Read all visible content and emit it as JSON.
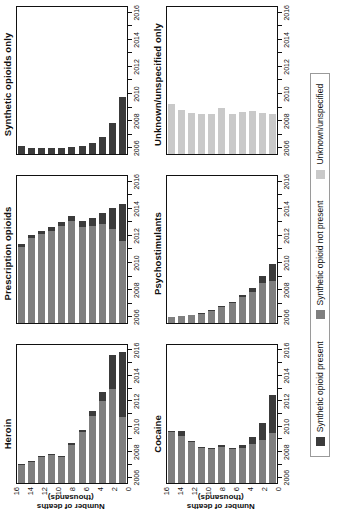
{
  "figure": {
    "y_axis_label": "Number of deaths (thousands)",
    "y_ticks": [
      "16",
      "14",
      "12",
      "10",
      "8",
      "6",
      "4",
      "2",
      "0"
    ],
    "x_tick_labels": [
      "2006",
      "2008",
      "2010",
      "2012",
      "2014",
      "2016"
    ]
  },
  "legend": {
    "items": [
      {
        "label": "Synthetic opioid present",
        "color": "#3b3b3b",
        "key": "present"
      },
      {
        "label": "Synthetic opioid not present",
        "color": "#7f7f7f",
        "key": "notpresent"
      },
      {
        "label": "Unknown/unspecified",
        "color": "#c9c9c9",
        "key": "unknown"
      }
    ]
  },
  "panels": [
    {
      "title": "Heroin"
    },
    {
      "title": "Prescription opioids"
    },
    {
      "title": "Synthetic opioids only"
    },
    {
      "title": "Cocaine"
    },
    {
      "title": "Psychostimulants"
    },
    {
      "title": "Unknown/unspecified only"
    }
  ],
  "chart_data": [
    {
      "type": "bar",
      "title": "Heroin",
      "xlabel": "",
      "ylabel": "Number of deaths (thousands)",
      "ylim": [
        0,
        16
      ],
      "grid": false,
      "stacked": true,
      "orientation": "vertical-bars-rendered-horizontal",
      "categories": [
        "2006",
        "2007",
        "2008",
        "2009",
        "2010",
        "2011",
        "2012",
        "2013",
        "2014",
        "2015",
        "2016"
      ],
      "series": [
        {
          "name": "Synthetic opioid not present",
          "color": "#7f7f7f",
          "values": [
            2.1,
            2.4,
            3.0,
            3.3,
            3.0,
            4.4,
            5.9,
            7.8,
            9.5,
            10.9,
            7.6
          ]
        },
        {
          "name": "Synthetic opioid present",
          "color": "#3b3b3b",
          "values": [
            0.1,
            0.1,
            0.1,
            0.1,
            0.1,
            0.2,
            0.3,
            0.5,
            1.1,
            3.9,
            7.6
          ]
        }
      ],
      "totals": [
        2.2,
        2.5,
        3.1,
        3.4,
        3.1,
        4.6,
        6.2,
        8.3,
        10.6,
        14.8,
        15.2
      ]
    },
    {
      "type": "bar",
      "title": "Prescription opioids",
      "xlabel": "",
      "ylabel": "",
      "ylim": [
        0,
        16
      ],
      "grid": false,
      "stacked": true,
      "categories": [
        "2006",
        "2007",
        "2008",
        "2009",
        "2010",
        "2011",
        "2012",
        "2013",
        "2014",
        "2015",
        "2016"
      ],
      "series": [
        {
          "name": "Synthetic opioid not present",
          "color": "#7f7f7f",
          "values": [
            8.3,
            9.3,
            9.7,
            10.0,
            10.6,
            11.1,
            10.5,
            10.6,
            10.8,
            10.2,
            8.9
          ]
        },
        {
          "name": "Synthetic opioid present",
          "color": "#3b3b3b",
          "values": [
            0.3,
            0.3,
            0.3,
            0.4,
            0.4,
            0.5,
            0.6,
            0.8,
            1.2,
            2.3,
            4.0
          ]
        }
      ],
      "totals": [
        8.6,
        9.6,
        10.0,
        10.4,
        11.0,
        11.6,
        11.1,
        11.4,
        12.0,
        12.5,
        12.9
      ]
    },
    {
      "type": "bar",
      "title": "Synthetic opioids only",
      "xlabel": "",
      "ylabel": "",
      "ylim": [
        0,
        16
      ],
      "grid": false,
      "stacked": true,
      "categories": [
        "2006",
        "2007",
        "2008",
        "2009",
        "2010",
        "2011",
        "2012",
        "2013",
        "2014",
        "2015",
        "2016"
      ],
      "series": [
        {
          "name": "Synthetic opioid present",
          "color": "#3b3b3b",
          "values": [
            0.9,
            0.6,
            0.6,
            0.6,
            0.7,
            0.8,
            0.9,
            1.2,
            1.9,
            3.4,
            6.2
          ]
        }
      ],
      "totals": [
        0.9,
        0.6,
        0.6,
        0.6,
        0.7,
        0.8,
        0.9,
        1.2,
        1.9,
        3.4,
        6.2
      ]
    },
    {
      "type": "bar",
      "title": "Cocaine",
      "xlabel": "",
      "ylabel": "Number of deaths (thousands)",
      "ylim": [
        0,
        16
      ],
      "grid": false,
      "stacked": true,
      "categories": [
        "2006",
        "2007",
        "2008",
        "2009",
        "2010",
        "2011",
        "2012",
        "2013",
        "2014",
        "2015",
        "2016"
      ],
      "series": [
        {
          "name": "Synthetic opioid not present",
          "color": "#7f7f7f",
          "values": [
            5.9,
            5.4,
            4.8,
            4.0,
            3.9,
            4.2,
            3.9,
            4.1,
            4.5,
            5.0,
            5.8
          ]
        },
        {
          "name": "Synthetic opioid present",
          "color": "#3b3b3b",
          "values": [
            0.1,
            0.6,
            0.1,
            0.1,
            0.1,
            0.2,
            0.2,
            0.3,
            0.8,
            1.9,
            4.4
          ]
        }
      ],
      "totals": [
        6.0,
        6.0,
        4.9,
        4.1,
        4.0,
        4.4,
        4.1,
        4.4,
        5.3,
        6.9,
        10.2
      ]
    },
    {
      "type": "bar",
      "title": "Psychostimulants",
      "xlabel": "",
      "ylabel": "",
      "ylim": [
        0,
        16
      ],
      "grid": false,
      "stacked": true,
      "categories": [
        "2006",
        "2007",
        "2008",
        "2009",
        "2010",
        "2011",
        "2012",
        "2013",
        "2014",
        "2015",
        "2016"
      ],
      "series": [
        {
          "name": "Synthetic opioid not present",
          "color": "#7f7f7f",
          "values": [
            0.7,
            0.8,
            0.9,
            1.0,
            1.3,
            1.7,
            2.2,
            2.8,
            3.4,
            4.3,
            4.6
          ]
        },
        {
          "name": "Synthetic opioid present",
          "color": "#3b3b3b",
          "values": [
            0.0,
            0.0,
            0.0,
            0.1,
            0.1,
            0.1,
            0.1,
            0.2,
            0.4,
            0.8,
            1.8
          ]
        }
      ],
      "totals": [
        0.7,
        0.8,
        0.9,
        1.1,
        1.4,
        1.8,
        2.3,
        3.0,
        3.8,
        5.1,
        6.4
      ]
    },
    {
      "type": "bar",
      "title": "Unknown/unspecified only",
      "xlabel": "",
      "ylabel": "",
      "ylim": [
        0,
        16
      ],
      "grid": false,
      "stacked": true,
      "categories": [
        "2006",
        "2007",
        "2008",
        "2009",
        "2010",
        "2011",
        "2012",
        "2013",
        "2014",
        "2015",
        "2016"
      ],
      "series": [
        {
          "name": "Unknown/unspecified",
          "color": "#c9c9c9",
          "values": [
            5.4,
            4.8,
            4.5,
            4.4,
            4.4,
            5.0,
            4.4,
            4.6,
            4.7,
            4.5,
            4.3
          ]
        }
      ],
      "totals": [
        5.4,
        4.8,
        4.5,
        4.4,
        4.4,
        5.0,
        4.4,
        4.6,
        4.7,
        4.5,
        4.3
      ]
    }
  ]
}
